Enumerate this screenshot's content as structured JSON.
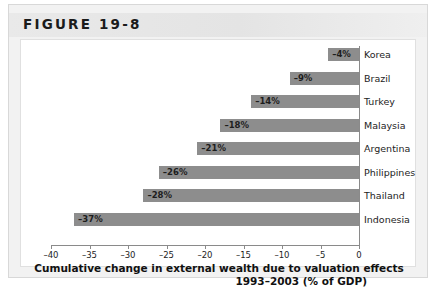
{
  "figure": {
    "title": "FIGURE 19-8"
  },
  "caption": {
    "line1": "Cumulative change in external wealth due to valuation effects",
    "line2": "1993–2003 (% of GDP)"
  },
  "colors": {
    "bar": "#8d8d8d",
    "axis": "#8a8a8a",
    "header_band": "#e7e7e7",
    "frame": "#f2f2f2"
  },
  "chart_data": {
    "type": "bar",
    "orientation": "horizontal",
    "title": "FIGURE 19-8",
    "xlabel": "Cumulative change in external wealth due to valuation effects 1993–2003 (% of GDP)",
    "ylabel": "",
    "xlim": [
      -40,
      0
    ],
    "xticks": [
      -40,
      -35,
      -30,
      -25,
      -20,
      -15,
      -10,
      -5,
      0
    ],
    "xticklabels": [
      "–40",
      "–35",
      "–30",
      "–25",
      "–20",
      "–15",
      "–10",
      "–5",
      "0"
    ],
    "grid": false,
    "legend": false,
    "categories": [
      "Korea",
      "Brazil",
      "Turkey",
      "Malaysia",
      "Argentina",
      "Philippines",
      "Thailand",
      "Indonesia"
    ],
    "values": [
      -4,
      -9,
      -14,
      -18,
      -21,
      -26,
      -28,
      -37
    ],
    "data_labels": [
      "–4%",
      "–9%",
      "–14%",
      "–18%",
      "–21%",
      "–26%",
      "–28%",
      "–37%"
    ]
  }
}
